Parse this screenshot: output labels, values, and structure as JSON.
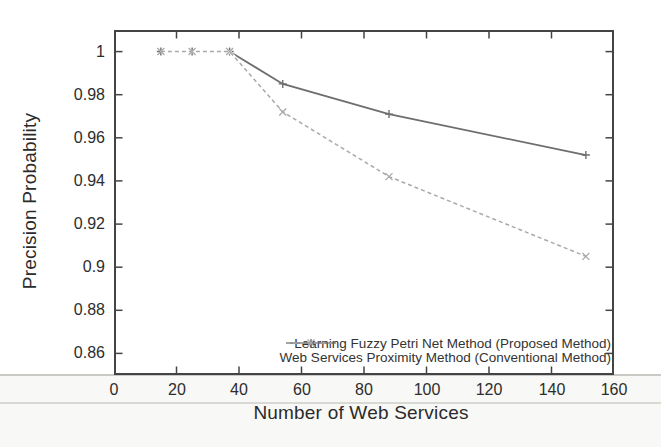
{
  "chart_data": {
    "type": "line",
    "title": "",
    "xlabel": "Number of Web Services",
    "ylabel": "Precision Probability",
    "xlim": [
      0,
      160
    ],
    "ylim": [
      0.85,
      1.01
    ],
    "xticks": [
      0,
      20,
      40,
      60,
      80,
      100,
      120,
      140,
      160
    ],
    "xtick_labels": [
      "0",
      "20",
      "40",
      "60",
      "80",
      "100",
      "120",
      "140",
      "160"
    ],
    "yticks": [
      0.86,
      0.88,
      0.9,
      0.92,
      0.94,
      0.96,
      0.98,
      1
    ],
    "ytick_labels": [
      "0.86",
      "0.88",
      "0.9",
      "0.92",
      "0.94",
      "0.96",
      "0.98",
      "1"
    ],
    "grid": false,
    "legend_position": "inside-bottom-right",
    "frame_color": "#444444",
    "x": [
      15,
      25,
      37,
      54,
      88,
      151
    ],
    "series": [
      {
        "name": "Learning Fuzzy Petri Net Method (Proposed Method)",
        "values": [
          1.0,
          1.0,
          1.0,
          0.985,
          0.971,
          0.952
        ],
        "style": "solid",
        "marker": "plus",
        "color": "#6e6e6e"
      },
      {
        "name": "Web Services Proximity Method (Conventional Method)",
        "values": [
          1.0,
          1.0,
          1.0,
          0.972,
          0.942,
          0.905
        ],
        "style": "dashed",
        "marker": "x",
        "color": "#a9a9a9"
      }
    ]
  }
}
